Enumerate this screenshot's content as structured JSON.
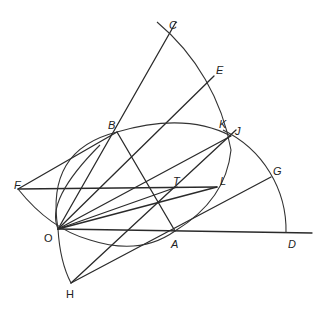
{
  "figure": {
    "type": "geometric-construction",
    "points": [
      {
        "id": "C",
        "label": "C",
        "x": 172,
        "y": 28,
        "lx": 169,
        "ly": 20
      },
      {
        "id": "E",
        "label": "E",
        "x": 214,
        "y": 76,
        "lx": 216,
        "ly": 65
      },
      {
        "id": "B",
        "label": "B",
        "x": 117,
        "y": 132,
        "lx": 108,
        "ly": 120
      },
      {
        "id": "K",
        "label": "K",
        "x": 228,
        "y": 133,
        "lx": 219,
        "ly": 119
      },
      {
        "id": "J",
        "label": "J",
        "x": 231,
        "y": 136,
        "lx": 235,
        "ly": 126
      },
      {
        "id": "F",
        "label": "F",
        "x": 18,
        "y": 189,
        "lx": 14,
        "ly": 180
      },
      {
        "id": "T",
        "label": "T",
        "x": 177,
        "y": 187,
        "lx": 173,
        "ly": 176
      },
      {
        "id": "L",
        "label": "L",
        "x": 217,
        "y": 187,
        "lx": 220,
        "ly": 176
      },
      {
        "id": "G",
        "label": "G",
        "x": 271,
        "y": 177,
        "lx": 273,
        "ly": 166
      },
      {
        "id": "O",
        "label": "O",
        "x": 58,
        "y": 229,
        "lx": 44,
        "ly": 233
      },
      {
        "id": "A",
        "label": "A",
        "x": 175,
        "y": 231,
        "lx": 171,
        "ly": 239
      },
      {
        "id": "D",
        "label": "D",
        "x": 286,
        "y": 233,
        "lx": 288,
        "ly": 239
      },
      {
        "id": "H",
        "label": "H",
        "x": 71,
        "y": 283,
        "lx": 66,
        "ly": 289
      }
    ],
    "segments": [
      [
        "O",
        "C"
      ],
      [
        "O",
        "E"
      ],
      [
        "O",
        "J"
      ],
      [
        "O",
        "T"
      ],
      [
        "O",
        "L"
      ],
      [
        "O",
        "D"
      ],
      [
        "F",
        "L"
      ],
      [
        "F",
        "B"
      ],
      [
        "B",
        "A"
      ],
      [
        "H",
        "J"
      ],
      [
        "H",
        "G"
      ]
    ],
    "arcs": [
      "arc C-E-K-A (large circle)",
      "arc B-O-H (left circle)",
      "arc K-J-G-D centered at A",
      "arc F-O-A (lower bowl)",
      "circle through O-B-K"
    ]
  }
}
